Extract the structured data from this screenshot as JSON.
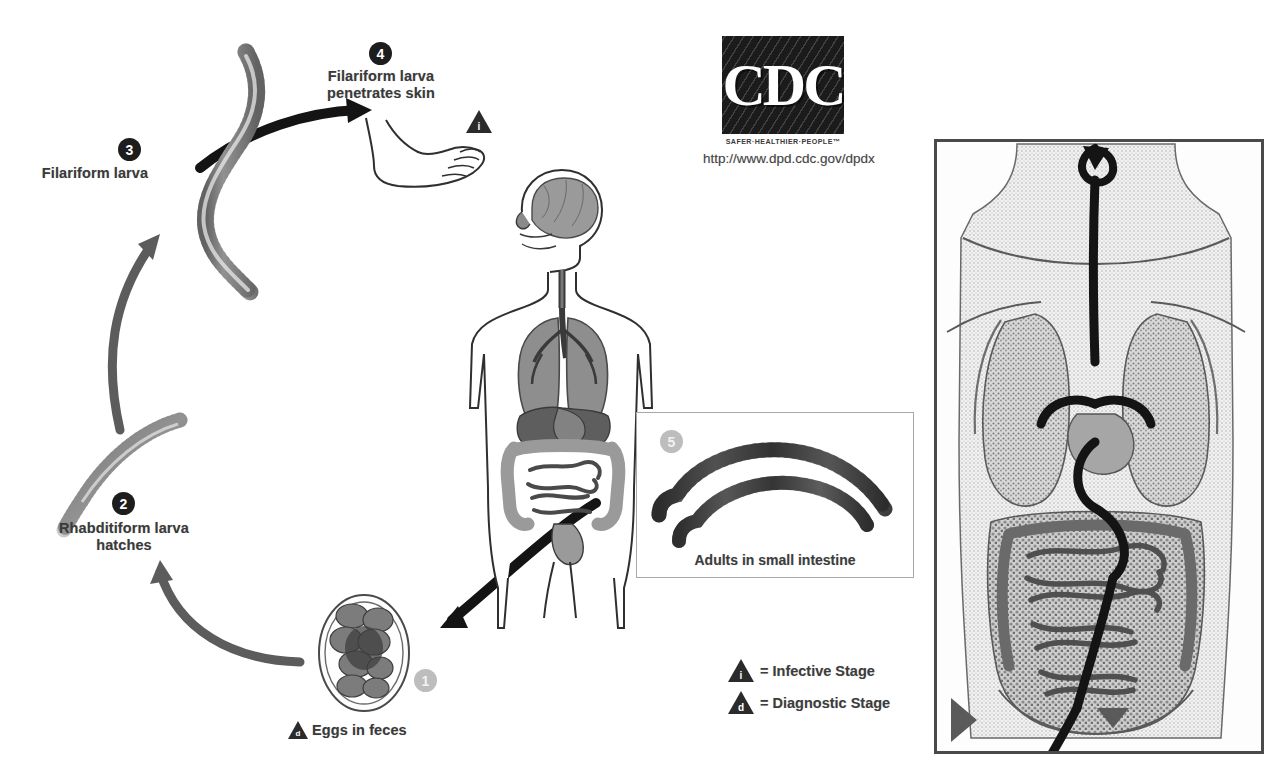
{
  "diagram": {
    "background_color": "#ffffff"
  },
  "branding": {
    "logo_text": "CDC",
    "tagline": "SAFER·HEALTHIER·PEOPLE™",
    "url": "http://www.dpd.cdc.gov/dpdx"
  },
  "steps": [
    {
      "number": "1",
      "badge_style": "grey",
      "label": "Eggs in feces",
      "marker": "d",
      "marker_meaning": "Diagnostic Stage"
    },
    {
      "number": "2",
      "badge_style": "dark",
      "label": "Rhabditiform larva\nhatches",
      "marker": "",
      "marker_meaning": ""
    },
    {
      "number": "3",
      "badge_style": "dark",
      "label": "Filariform larva",
      "marker": "",
      "marker_meaning": ""
    },
    {
      "number": "4",
      "badge_style": "dark",
      "label": "Filariform larva\npenetrates skin",
      "marker": "i",
      "marker_meaning": "Infective Stage"
    },
    {
      "number": "5",
      "badge_style": "grey",
      "label": "Adults in small intestine",
      "marker": "",
      "marker_meaning": ""
    }
  ],
  "legend": {
    "items": [
      {
        "glyph": "i",
        "text": "= Infective Stage"
      },
      {
        "glyph": "d",
        "text": "= Diagnostic Stage"
      }
    ]
  },
  "figures": {
    "human_body": "human-body-anatomy-illustration",
    "foot": "foot-illustration",
    "egg": "parasite-egg-illustration",
    "rhabditiform_larva": "rhabditiform-larva-illustration",
    "filariform_larva": "filariform-larva-illustration",
    "adult_worms": "adult-worms-illustration",
    "torso_panel": "torso-anatomy-migration-panel"
  },
  "colors": {
    "arrow_dark": "#1b1b1b",
    "arrow_grey": "#5c5c5c",
    "organ_fill": "#9a9a9a",
    "organ_dark": "#6b6b6b",
    "outline": "#2f2f2f",
    "badge_dark": "#1d1d1d",
    "badge_grey": "#bdbdbd",
    "text": "#3a3a3a"
  }
}
